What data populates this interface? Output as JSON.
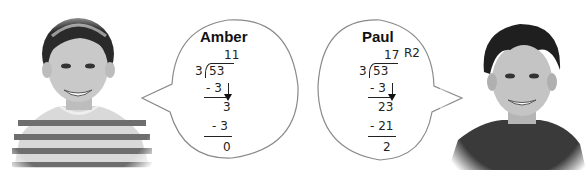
{
  "scene": {
    "description": "Two students compare long division of 53 by 3"
  },
  "students": [
    {
      "name": "Amber",
      "photo_icon": "girl-portrait",
      "division": {
        "divisor": "3",
        "dividend": "53",
        "quotient": "11",
        "remainder_label": "",
        "steps": [
          "- 3",
          "3",
          "- 3",
          "0"
        ]
      }
    },
    {
      "name": "Paul",
      "photo_icon": "boy-portrait",
      "division": {
        "divisor": "3",
        "dividend": "53",
        "quotient": "17",
        "remainder_label": "R2",
        "steps": [
          "- 3",
          "23",
          "- 21",
          "2"
        ]
      }
    }
  ],
  "colors": {
    "bubble_stroke": "#8a8a8a",
    "bubble_fill": "#ffffff",
    "ink": "#222222"
  }
}
